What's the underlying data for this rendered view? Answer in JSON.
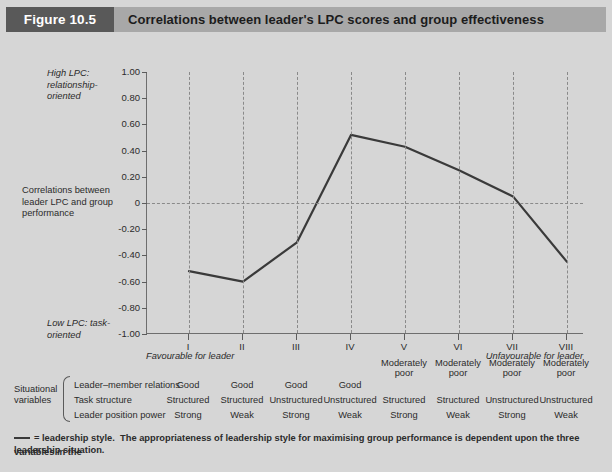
{
  "header": {
    "badge": "Figure 10.5",
    "title": "Correlations between leader's LPC scores and group effectiveness"
  },
  "annotations": {
    "high_lpc": "High LPC: relationship-oriented",
    "correlations": "Correlations between leader LPC and group performance",
    "low_lpc": "Low LPC: task-oriented",
    "favourable": "Favourable for leader",
    "unfavourable": "Unfavourable for leader"
  },
  "table": {
    "group_label": "Situational variables",
    "rows": [
      {
        "label": "Leader–member relations",
        "values": [
          "Good",
          "Good",
          "Good",
          "Good",
          "Moderately poor",
          "Moderately poor",
          "Moderately poor",
          "Moderately poor"
        ]
      },
      {
        "label": "Task structure",
        "values": [
          "Structured",
          "Structured",
          "Unstructured",
          "Unstructured",
          "Structured",
          "Structured",
          "Unstructured",
          "Unstructured"
        ]
      },
      {
        "label": "Leader position power",
        "values": [
          "Strong",
          "Weak",
          "Strong",
          "Weak",
          "Strong",
          "Weak",
          "Strong",
          "Weak"
        ]
      }
    ]
  },
  "footnote": {
    "legend_text": "= leadership style.",
    "line1": "The appropriateness of leadership style for maximising group performance is dependent upon the three variables in the",
    "line2": "leadership situation."
  },
  "colors": {
    "badge_bg": "#595959",
    "title_bg": "#a8a8a8",
    "page_bg": "#d6d6d6",
    "line": "#3a3a3a",
    "grid": "#8a8a8a",
    "axis": "#6e6e6e"
  },
  "chart_data": {
    "type": "line",
    "title": "Correlations between leader's LPC scores and group effectiveness",
    "xlabel": "",
    "ylabel": "Correlations between leader LPC and group performance",
    "categories": [
      "I",
      "II",
      "III",
      "IV",
      "V",
      "VI",
      "VII",
      "VIII"
    ],
    "values": [
      -0.52,
      -0.6,
      -0.3,
      0.52,
      0.43,
      0.25,
      0.05,
      -0.45
    ],
    "series": [
      {
        "name": "leadership style",
        "values": [
          -0.52,
          -0.6,
          -0.3,
          0.52,
          0.43,
          0.25,
          0.05,
          -0.45
        ]
      }
    ],
    "ylim": [
      -1.0,
      1.0
    ],
    "yticks": [
      1.0,
      0.8,
      0.6,
      0.4,
      0.2,
      0,
      -0.2,
      -0.4,
      -0.6,
      -0.8,
      -1.0
    ],
    "ytick_labels": [
      "1.00",
      "0.80",
      "0.60",
      "0.40",
      "0.20",
      "0",
      "-0.20",
      "-0.40",
      "-0.60",
      "-0.80",
      "-1.00"
    ],
    "grid": "vertical dashed at each category, horizontal dashed at y=0",
    "legend": "none"
  }
}
